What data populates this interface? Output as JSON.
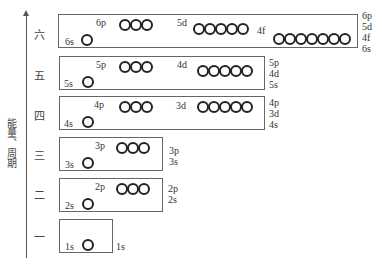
{
  "axis_label": "能量、周期",
  "periods": [
    {
      "name": "六",
      "s": "6s",
      "p": "6p",
      "d": "5d",
      "f": "4f",
      "order": [
        "6p",
        "5d",
        "4f",
        "6s"
      ]
    },
    {
      "name": "五",
      "s": "5s",
      "p": "5p",
      "d": "4d",
      "order": [
        "5p",
        "4d",
        "5s"
      ]
    },
    {
      "name": "四",
      "s": "4s",
      "p": "4p",
      "d": "3d",
      "order": [
        "4p",
        "3d",
        "4s"
      ]
    },
    {
      "name": "三",
      "s": "3s",
      "p": "3p",
      "order": [
        "3p",
        "3s"
      ]
    },
    {
      "name": "二",
      "s": "2s",
      "p": "2p",
      "order": [
        "2p",
        "2s"
      ]
    },
    {
      "name": "一",
      "s": "1s",
      "order": [
        "1s"
      ]
    }
  ]
}
